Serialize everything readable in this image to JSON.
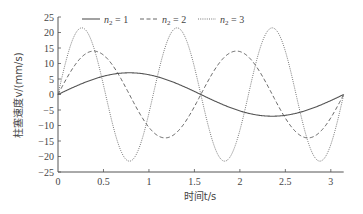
{
  "chart_data": {
    "type": "line",
    "title": "",
    "xlabel": "时间t/s",
    "ylabel": "柱塞速度v/(mm/s)",
    "xlim": [
      0,
      3.1416
    ],
    "ylim": [
      -25,
      25
    ],
    "xticks": [
      0,
      0.5,
      1,
      1.5,
      2,
      2.5,
      3
    ],
    "xtick_labels": [
      "0",
      "0.5",
      "1",
      "1.5",
      "2",
      "2.5",
      "3"
    ],
    "yticks": [
      -25,
      -20,
      -15,
      -10,
      -5,
      0,
      5,
      10,
      15,
      20,
      25
    ],
    "ytick_labels": [
      "-25",
      "-20",
      "-15",
      "-10",
      "-5",
      "0",
      "5",
      "10",
      "15",
      "20",
      "25"
    ],
    "grid": false,
    "legend_position": "top",
    "series": [
      {
        "name": "n2 = 1",
        "legend_sub": "2",
        "legend_value": "1",
        "style": "solid",
        "amplitude": 7,
        "frequency": 2,
        "description": "v = 7·sin(2t)",
        "peak": {
          "t": 0.785,
          "v": 7
        },
        "trough": {
          "t": 2.356,
          "v": -7
        }
      },
      {
        "name": "n2 = 2",
        "legend_sub": "2",
        "legend_value": "2",
        "style": "dashed",
        "amplitude": 14,
        "frequency": 4,
        "description": "v = 14·sin(4t)",
        "peak": {
          "t": 0.39,
          "v": 14
        },
        "trough": {
          "t": 1.18,
          "v": -14
        }
      },
      {
        "name": "n2 = 3",
        "legend_sub": "2",
        "legend_value": "3",
        "style": "dotted",
        "amplitude": 21.5,
        "frequency": 6,
        "description": "v = 21.5·sin(6t)",
        "peak": {
          "t": 0.26,
          "v": 21.5
        },
        "trough": {
          "t": 0.785,
          "v": -21.5
        }
      }
    ]
  },
  "colors": {
    "axis": "#555555",
    "series1": "#555555",
    "series2": "#555555",
    "series3": "#666666"
  }
}
